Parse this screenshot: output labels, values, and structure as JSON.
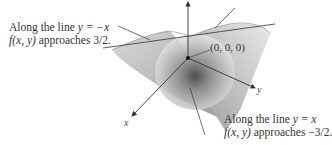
{
  "figure": {
    "type": "3d-surface-plot",
    "annotations": {
      "top_left": {
        "line1_prefix": "Along the line ",
        "line1_eq": "y = −x",
        "line2_fn": "f(x, y)",
        "line2_rest": " approaches 3/2."
      },
      "bottom_right": {
        "line1_prefix": "Along the line ",
        "line1_eq": "y = x",
        "line2_fn": "f(x, y)",
        "line2_rest": " approaches −3/2."
      }
    },
    "origin_label": "(0, 0, 0)",
    "axes": {
      "x": "x",
      "y": "y",
      "z": "z"
    },
    "colors": {
      "surface_light": "#e6e6e6",
      "surface_mid": "#b8b8b8",
      "surface_dark": "#4a4a4a",
      "axis": "#333333",
      "text": "#333333"
    }
  }
}
